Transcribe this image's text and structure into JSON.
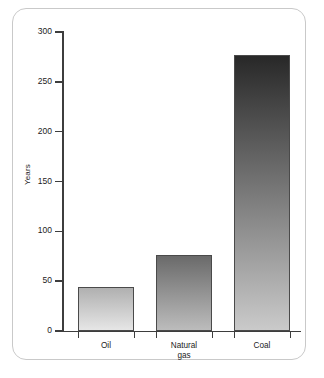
{
  "chart_data": {
    "type": "bar",
    "title": "",
    "subtitle": "",
    "xlabel": "",
    "ylabel": "Years",
    "categories": [
      "Oil",
      "Natural gas",
      "Coal"
    ],
    "values": [
      44,
      76,
      277
    ],
    "ylim": [
      0,
      300
    ],
    "yticks": [
      0,
      50,
      100,
      150,
      200,
      250,
      300
    ],
    "ytick_labels": [
      "0",
      "50",
      "100",
      "150",
      "200",
      "250",
      "300"
    ],
    "grid": false,
    "legend": null,
    "annotations": [],
    "series": [
      {
        "name": "Reserves-to-production ratio",
        "values": [
          44,
          76,
          277
        ]
      }
    ]
  },
  "axis": {
    "y_title": "Years",
    "ticks": [
      {
        "value": 300,
        "label": "300"
      },
      {
        "value": 250,
        "label": "250"
      },
      {
        "value": 200,
        "label": "200"
      },
      {
        "value": 150,
        "label": "150"
      },
      {
        "value": 100,
        "label": "100"
      },
      {
        "value": 50,
        "label": "50"
      },
      {
        "value": 0,
        "label": "0"
      }
    ]
  },
  "bars": [
    {
      "category": "Oil",
      "label_line1": "Oil",
      "label_line2": "",
      "value": 44,
      "color_top": "#b0b0b0",
      "color_bottom": "#e6e6e6"
    },
    {
      "category": "Natural gas",
      "label_line1": "Natural",
      "label_line2": "gas",
      "value": 76,
      "color_top": "#6a6a6a",
      "color_bottom": "#bcbcbc"
    },
    {
      "category": "Coal",
      "label_line1": "Coal",
      "label_line2": "",
      "value": 277,
      "color_top": "#282828",
      "color_bottom": "#cacaca"
    }
  ],
  "style": {
    "axis_color": "#3d3d3d",
    "frame_color": "#c9c9c9",
    "text_color": "#1c1c1c",
    "background": "#ffffff"
  }
}
